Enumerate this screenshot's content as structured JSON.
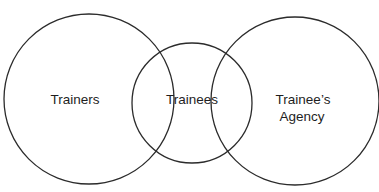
{
  "diagram": {
    "type": "venn",
    "stroke_color": "#2b2b2b",
    "text_color": "#1e1e1e",
    "background": "#ffffff",
    "circles": [
      {
        "id": "trainers",
        "label": "Trainers",
        "cx": 89,
        "cy": 99,
        "r": 85
      },
      {
        "id": "trainees",
        "label": "Trainees",
        "cx": 192,
        "cy": 103,
        "r": 60
      },
      {
        "id": "agency",
        "label_lines": [
          "Trainee’s",
          "Agency"
        ],
        "cx": 295,
        "cy": 101,
        "r": 84
      }
    ],
    "labels": {
      "trainers": "Trainers",
      "trainees": "Trainees",
      "agency_line1": "Trainee’s",
      "agency_line2": "Agency"
    }
  }
}
